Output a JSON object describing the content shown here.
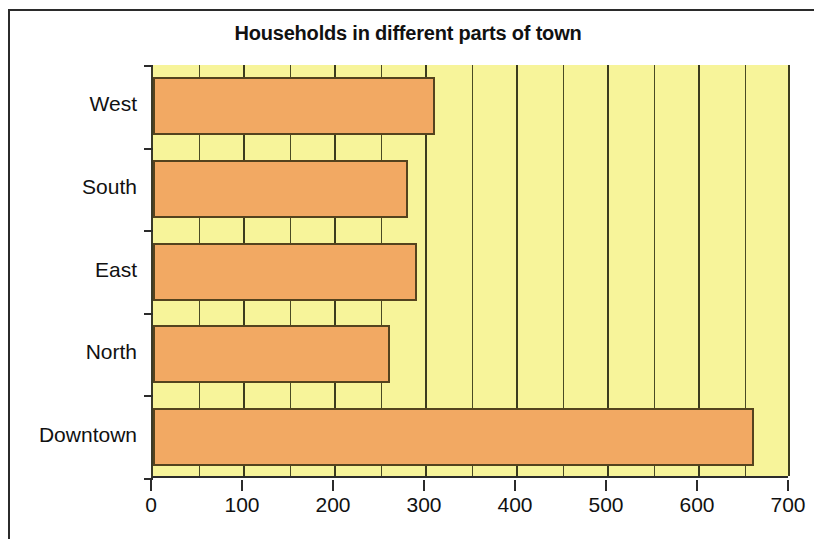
{
  "frame": {
    "visible": true
  },
  "chart_data": {
    "type": "bar",
    "orientation": "horizontal",
    "title": "Households in different parts of town",
    "xlabel": "",
    "ylabel": "",
    "categories": [
      "West",
      "South",
      "East",
      "North",
      "Downtown"
    ],
    "values": [
      310,
      280,
      290,
      260,
      660
    ],
    "xlim": [
      0,
      700
    ],
    "xtick_labels": [
      "0",
      "100",
      "200",
      "300",
      "400",
      "500",
      "600",
      "700"
    ],
    "xtick_values": [
      0,
      100,
      200,
      300,
      400,
      500,
      600,
      700
    ],
    "minor_gridline_step": 50,
    "grid": true,
    "legend": false,
    "colors": {
      "bar_fill": "#F2A963",
      "bar_border": "#54431E",
      "plot_background": "#F7F49A",
      "gridline": "#4A4A24",
      "axis": "#2B2B2B",
      "title_text": "#111111",
      "tick_text": "#111111",
      "page_background": "#FFFFFF"
    }
  }
}
